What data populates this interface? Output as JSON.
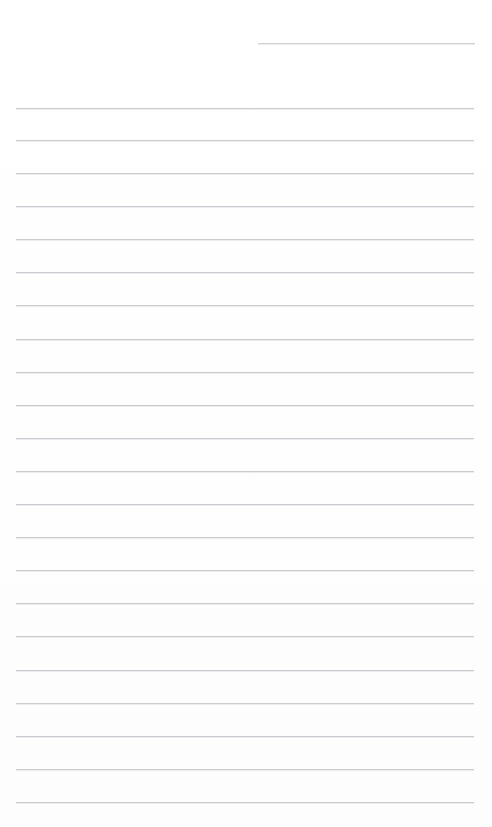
{
  "document": {
    "kind": "ruled-paper-scan",
    "title": "Blank lined paper",
    "page_number": "",
    "content_text": "",
    "background_color": "#ffffff",
    "rule_color": "#c9c9ce",
    "canvas": {
      "width": 492,
      "height": 827
    }
  },
  "header_rule": {
    "name": "header-rule",
    "x": 258,
    "y": 43,
    "width": 217,
    "color": "#cdcdd2",
    "label": ""
  },
  "ruling": {
    "left_margin": 16,
    "right_margin": 474,
    "first_line_y": 108,
    "line_spacing": 33,
    "line_count": 22,
    "color": "#c9c9ce",
    "thickness": 1
  },
  "rules": [
    {
      "index": 1,
      "y": 108,
      "x": 16,
      "width": 458,
      "text": ""
    },
    {
      "index": 2,
      "y": 140,
      "x": 16,
      "width": 458,
      "text": ""
    },
    {
      "index": 3,
      "y": 173,
      "x": 16,
      "width": 458,
      "text": ""
    },
    {
      "index": 4,
      "y": 206,
      "x": 16,
      "width": 458,
      "text": ""
    },
    {
      "index": 5,
      "y": 239,
      "x": 16,
      "width": 458,
      "text": ""
    },
    {
      "index": 6,
      "y": 272,
      "x": 16,
      "width": 458,
      "text": ""
    },
    {
      "index": 7,
      "y": 305,
      "x": 16,
      "width": 458,
      "text": ""
    },
    {
      "index": 8,
      "y": 339,
      "x": 16,
      "width": 458,
      "text": ""
    },
    {
      "index": 9,
      "y": 372,
      "x": 16,
      "width": 458,
      "text": ""
    },
    {
      "index": 10,
      "y": 405,
      "x": 16,
      "width": 458,
      "text": ""
    },
    {
      "index": 11,
      "y": 438,
      "x": 16,
      "width": 458,
      "text": ""
    },
    {
      "index": 12,
      "y": 471,
      "x": 16,
      "width": 458,
      "text": ""
    },
    {
      "index": 13,
      "y": 504,
      "x": 16,
      "width": 458,
      "text": ""
    },
    {
      "index": 14,
      "y": 537,
      "x": 16,
      "width": 458,
      "text": ""
    },
    {
      "index": 15,
      "y": 570,
      "x": 16,
      "width": 458,
      "text": ""
    },
    {
      "index": 16,
      "y": 603,
      "x": 16,
      "width": 458,
      "text": ""
    },
    {
      "index": 17,
      "y": 636,
      "x": 16,
      "width": 458,
      "text": ""
    },
    {
      "index": 18,
      "y": 670,
      "x": 16,
      "width": 458,
      "text": ""
    },
    {
      "index": 19,
      "y": 703,
      "x": 16,
      "width": 458,
      "text": ""
    },
    {
      "index": 20,
      "y": 736,
      "x": 16,
      "width": 458,
      "text": ""
    },
    {
      "index": 21,
      "y": 769,
      "x": 16,
      "width": 458,
      "text": ""
    },
    {
      "index": 22,
      "y": 802,
      "x": 16,
      "width": 458,
      "text": ""
    }
  ]
}
